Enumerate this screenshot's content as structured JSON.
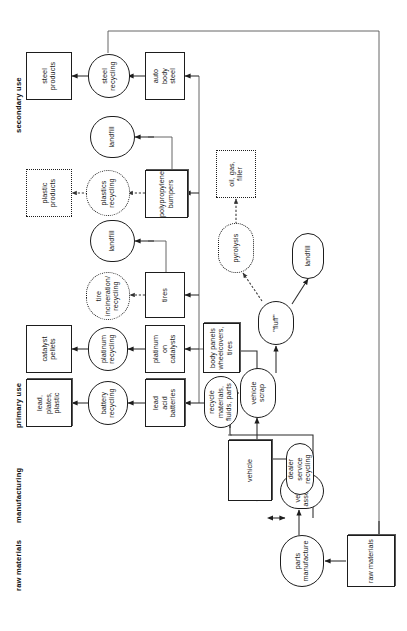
{
  "diagram": {
    "orientation": "rotated-90-ccw",
    "stage_headers": [
      {
        "id": "raw-materials",
        "label": "raw materials"
      },
      {
        "id": "manufacturing",
        "label": "manufacturing"
      },
      {
        "id": "primary-use",
        "label": "primary use"
      },
      {
        "id": "secondary-use",
        "label": "secondary use"
      }
    ],
    "nodes": [
      {
        "id": "raw-materials-box",
        "label": "raw materials",
        "shape": "box-heavy"
      },
      {
        "id": "parts-manufacture",
        "label": "parts\nmanufacture",
        "shape": "oval"
      },
      {
        "id": "vehicle-assembly",
        "label": "vehicle\nassembly",
        "shape": "oval"
      },
      {
        "id": "vehicle",
        "label": "vehicle",
        "shape": "box-heavy"
      },
      {
        "id": "dealer-service",
        "label": "dealer\nservice\nrecycling",
        "shape": "oval"
      },
      {
        "id": "vehicle-scrap",
        "label": "vehicle\nscrap",
        "shape": "oval"
      },
      {
        "id": "fluff",
        "label": "\"fluff\"",
        "shape": "oval"
      },
      {
        "id": "landfill-fluff",
        "label": "landfill",
        "shape": "oval"
      },
      {
        "id": "pyrolysis",
        "label": "pyrolysis",
        "shape": "dash-oval"
      },
      {
        "id": "oil-gas-filler",
        "label": "oil, gas,\nfiller",
        "shape": "dash-box"
      },
      {
        "id": "recycle-materials",
        "label": "recycle\nmaterials,\nfluids, parts",
        "shape": "oval"
      },
      {
        "id": "body-panels",
        "label": "body panels\nwheelcovers,\ntires",
        "shape": "box-heavy"
      },
      {
        "id": "lead-acid-batteries",
        "label": "lead\nacid\nbatteries",
        "shape": "box-heavy"
      },
      {
        "id": "platinum-catalysts",
        "label": "platinum\non\ncatalysts",
        "shape": "box"
      },
      {
        "id": "tires",
        "label": "tires",
        "shape": "box"
      },
      {
        "id": "polypropylene",
        "label": "polypropylene\nbumpers",
        "shape": "box-heavy"
      },
      {
        "id": "auto-body-steel",
        "label": "auto\nbody\nsteel",
        "shape": "box"
      },
      {
        "id": "battery-recycling",
        "label": "battery\nrecycling",
        "shape": "oval"
      },
      {
        "id": "platinum-recycling",
        "label": "platinum\nrecycling",
        "shape": "oval"
      },
      {
        "id": "tire-incineration",
        "label": "tire\nincineration/\nrecycling",
        "shape": "dash-oval"
      },
      {
        "id": "landfill-tires",
        "label": "landfill",
        "shape": "oval"
      },
      {
        "id": "plastics-recycling",
        "label": "plastics\nrecycling",
        "shape": "dash-oval"
      },
      {
        "id": "landfill-plastics",
        "label": "landfill",
        "shape": "oval"
      },
      {
        "id": "steel-recycling",
        "label": "steel\nrecycling",
        "shape": "oval"
      },
      {
        "id": "lead-plates-plastic",
        "label": "lead,\nplates,\nplastic",
        "shape": "box-heavy"
      },
      {
        "id": "catalyst-pellets",
        "label": "catalyst\npellets",
        "shape": "box"
      },
      {
        "id": "plastic-products",
        "label": "plastic\nproducts",
        "shape": "dash-box"
      },
      {
        "id": "steel-products",
        "label": "steel\nproducts",
        "shape": "box"
      }
    ],
    "edges": [
      {
        "from": "raw-materials-box",
        "to": "parts-manufacture",
        "style": "solid"
      },
      {
        "from": "parts-manufacture",
        "to": "vehicle-assembly",
        "style": "solid"
      },
      {
        "from": "vehicle-assembly",
        "to": "vehicle",
        "style": "solid"
      },
      {
        "from": "vehicle",
        "to": "dealer-service",
        "style": "solid-bidirectional"
      },
      {
        "from": "vehicle",
        "to": "vehicle-scrap",
        "style": "solid"
      },
      {
        "from": "dealer-service",
        "to": "recycle-materials",
        "style": "solid"
      },
      {
        "from": "vehicle-scrap",
        "to": "recycle-materials",
        "style": "solid"
      },
      {
        "from": "vehicle-scrap",
        "to": "body-panels",
        "style": "solid"
      },
      {
        "from": "vehicle-scrap",
        "to": "fluff",
        "style": "solid"
      },
      {
        "from": "fluff",
        "to": "landfill-fluff",
        "style": "solid"
      },
      {
        "from": "fluff",
        "to": "pyrolysis",
        "style": "dashed"
      },
      {
        "from": "pyrolysis",
        "to": "oil-gas-filler",
        "style": "dashed"
      },
      {
        "from": "recycle-materials",
        "to": "lead-acid-batteries",
        "style": "solid"
      },
      {
        "from": "body-panels",
        "to": "platinum-catalysts",
        "style": "solid"
      },
      {
        "from": "body-panels",
        "to": "tires",
        "style": "solid"
      },
      {
        "from": "body-panels",
        "to": "polypropylene",
        "style": "solid"
      },
      {
        "from": "body-panels",
        "to": "auto-body-steel",
        "style": "solid"
      },
      {
        "from": "lead-acid-batteries",
        "to": "battery-recycling",
        "style": "solid"
      },
      {
        "from": "battery-recycling",
        "to": "lead-plates-plastic",
        "style": "solid"
      },
      {
        "from": "platinum-catalysts",
        "to": "platinum-recycling",
        "style": "solid"
      },
      {
        "from": "platinum-recycling",
        "to": "catalyst-pellets",
        "style": "solid"
      },
      {
        "from": "tires",
        "to": "tire-incineration",
        "style": "dashed"
      },
      {
        "from": "tires",
        "to": "landfill-tires",
        "style": "solid"
      },
      {
        "from": "polypropylene",
        "to": "plastics-recycling",
        "style": "dashed"
      },
      {
        "from": "polypropylene",
        "to": "landfill-plastics",
        "style": "solid"
      },
      {
        "from": "plastics-recycling",
        "to": "plastic-products",
        "style": "dashed"
      },
      {
        "from": "auto-body-steel",
        "to": "steel-recycling",
        "style": "solid"
      },
      {
        "from": "steel-recycling",
        "to": "steel-products",
        "style": "solid"
      },
      {
        "from": "steel-recycling",
        "to": "raw-materials-box",
        "style": "solid-feedback"
      }
    ]
  }
}
